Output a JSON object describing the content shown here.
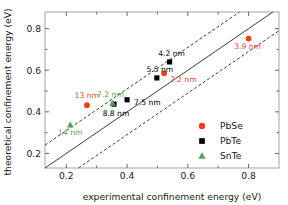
{
  "chart_data": {
    "type": "scatter",
    "title": "",
    "xlabel": "experimental confinement energy (eV)",
    "ylabel": "theoretical confinement energy (eV)",
    "xlim": [
      0.13,
      0.9
    ],
    "ylim": [
      0.13,
      0.88
    ],
    "xticks": [
      "0.2",
      "0.4",
      "0.6",
      "0.8"
    ],
    "xtick_values": [
      0.2,
      0.4,
      0.6,
      0.8
    ],
    "yticks": [
      "0.2",
      "0.4",
      "0.6",
      "0.8"
    ],
    "ytick_values": [
      0.2,
      0.4,
      0.6,
      0.8
    ],
    "grid": false,
    "legend_position": "lower-right",
    "reference_lines": [
      {
        "name": "parity",
        "style": "solid",
        "slope": 1,
        "intercept": 0
      },
      {
        "name": "upper-bound",
        "style": "dashed",
        "slope": 1,
        "intercept": 0.11
      },
      {
        "name": "lower-bound",
        "style": "dashed",
        "slope": 1,
        "intercept": -0.11
      }
    ],
    "series": [
      {
        "name": "PbSe",
        "marker": "circle",
        "color": "#e8411c",
        "points": [
          {
            "x": 0.268,
            "y": 0.432,
            "label": "13 nm"
          },
          {
            "x": 0.522,
            "y": 0.585,
            "label": "7.2 nm"
          },
          {
            "x": 0.8,
            "y": 0.752,
            "label": "3.9 nm"
          }
        ]
      },
      {
        "name": "PbTe",
        "marker": "square",
        "color": "#000000",
        "points": [
          {
            "x": 0.357,
            "y": 0.437,
            "label": "8.8 nm"
          },
          {
            "x": 0.4,
            "y": 0.458,
            "label": "7.5 nm"
          },
          {
            "x": 0.498,
            "y": 0.563,
            "label": "5.5 nm"
          },
          {
            "x": 0.54,
            "y": 0.64,
            "label": "4.2 nm"
          }
        ]
      },
      {
        "name": "SnTe",
        "marker": "triangle",
        "color": "#5a9e5a",
        "points": [
          {
            "x": 0.213,
            "y": 0.337,
            "label": "14 nm"
          },
          {
            "x": 0.352,
            "y": 0.442,
            "label": "7.2 nm"
          }
        ]
      }
    ]
  },
  "legend": {
    "entries": [
      {
        "label": "PbSe",
        "marker": "circle",
        "color": "#e8411c"
      },
      {
        "label": "PbTe",
        "marker": "square",
        "color": "#000000"
      },
      {
        "label": "SnTe",
        "marker": "triangle",
        "color": "#5a9e5a"
      }
    ]
  }
}
